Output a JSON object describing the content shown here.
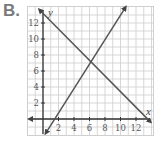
{
  "label": "B.",
  "chart_data": {
    "type": "line",
    "title": "",
    "xlabel": "x",
    "ylabel": "y",
    "xlim": [
      -2,
      14
    ],
    "ylim": [
      -2,
      14
    ],
    "grid": true,
    "x_ticks": [
      "2",
      "4",
      "6",
      "8",
      "10",
      "12"
    ],
    "y_ticks": [
      "2",
      "4",
      "6",
      "8",
      "10",
      "12"
    ],
    "series": [
      {
        "name": "decreasing line",
        "equation": "y = -x + 13",
        "points": [
          [
            0,
            13
          ],
          [
            6,
            7
          ],
          [
            13,
            0
          ]
        ],
        "color": "#555555"
      },
      {
        "name": "increasing line",
        "equation": "y = 1.5x - 2",
        "points": [
          [
            0,
            -2
          ],
          [
            6,
            7
          ],
          [
            10,
            13
          ]
        ],
        "color": "#555555"
      }
    ],
    "annotations": [
      {
        "type": "intersection",
        "x": 6,
        "y": 7
      }
    ]
  }
}
